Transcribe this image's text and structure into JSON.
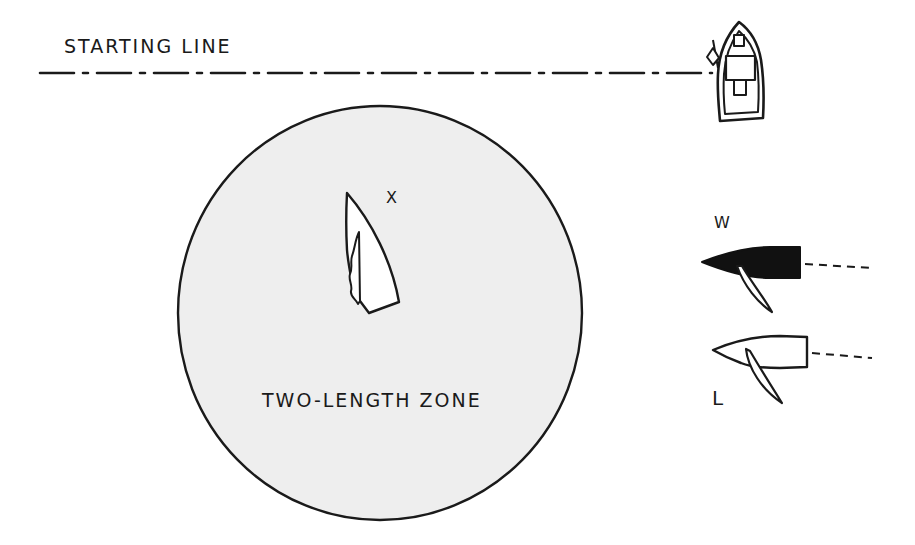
{
  "diagram": {
    "type": "sailing-rules-diagram",
    "labels": {
      "starting_line": "STARTING LINE",
      "zone": "TWO-LENGTH ZONE",
      "boat_x": "X",
      "boat_w": "W",
      "boat_l": "L"
    },
    "colors": {
      "ink": "#1a1a1a",
      "zone_fill": "#eeeeee",
      "background": "#ffffff",
      "boat_w_hull": "#111111",
      "boat_l_hull": "#ffffff"
    },
    "elements": [
      {
        "id": "starting-line",
        "kind": "dash-dot line",
        "from": [
          40,
          73
        ],
        "to": [
          712,
          73
        ]
      },
      {
        "id": "committee-boat",
        "kind": "boat with flag",
        "position": [
          740,
          72
        ]
      },
      {
        "id": "two-length-zone",
        "kind": "circle",
        "center": [
          380,
          313
        ],
        "rx": 202,
        "ry": 207
      },
      {
        "id": "boat-x",
        "kind": "sail (head-to-wind)",
        "position": [
          365,
          255
        ]
      },
      {
        "id": "boat-w",
        "kind": "windward boat, black hull",
        "position": [
          750,
          263
        ]
      },
      {
        "id": "boat-l",
        "kind": "leeward boat, white hull",
        "position": [
          760,
          352
        ]
      }
    ]
  }
}
